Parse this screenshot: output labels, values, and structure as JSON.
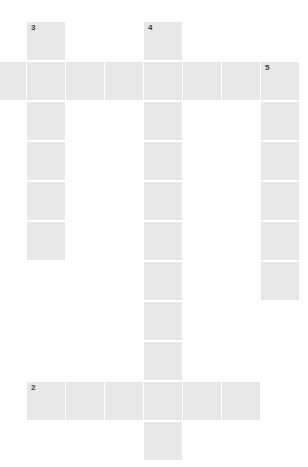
{
  "puzzle": {
    "type": "crossword",
    "cell_color": "#e7e7e7",
    "number_color": "#3a3a3a",
    "grid": {
      "col_x": [
        -12,
        27,
        66,
        105,
        144,
        183,
        222,
        261
      ],
      "row_y": [
        22,
        62,
        102,
        142,
        182,
        222,
        262,
        302,
        342,
        382,
        422
      ]
    },
    "cells": [
      {
        "r": 0,
        "c": 1,
        "num": "3"
      },
      {
        "r": 0,
        "c": 4,
        "num": "4"
      },
      {
        "r": 1,
        "c": 0
      },
      {
        "r": 1,
        "c": 1
      },
      {
        "r": 1,
        "c": 2
      },
      {
        "r": 1,
        "c": 3
      },
      {
        "r": 1,
        "c": 4
      },
      {
        "r": 1,
        "c": 5
      },
      {
        "r": 1,
        "c": 6
      },
      {
        "r": 1,
        "c": 7,
        "num": "5"
      },
      {
        "r": 2,
        "c": 1
      },
      {
        "r": 2,
        "c": 4
      },
      {
        "r": 2,
        "c": 7
      },
      {
        "r": 3,
        "c": 1
      },
      {
        "r": 3,
        "c": 4
      },
      {
        "r": 3,
        "c": 7
      },
      {
        "r": 4,
        "c": 1
      },
      {
        "r": 4,
        "c": 4
      },
      {
        "r": 4,
        "c": 7
      },
      {
        "r": 5,
        "c": 1
      },
      {
        "r": 5,
        "c": 4
      },
      {
        "r": 5,
        "c": 7
      },
      {
        "r": 6,
        "c": 4
      },
      {
        "r": 6,
        "c": 7
      },
      {
        "r": 7,
        "c": 4
      },
      {
        "r": 8,
        "c": 4
      },
      {
        "r": 9,
        "c": 1,
        "num": "2"
      },
      {
        "r": 9,
        "c": 2
      },
      {
        "r": 9,
        "c": 3
      },
      {
        "r": 9,
        "c": 4
      },
      {
        "r": 9,
        "c": 5
      },
      {
        "r": 9,
        "c": 6
      },
      {
        "r": 10,
        "c": 4
      }
    ]
  }
}
